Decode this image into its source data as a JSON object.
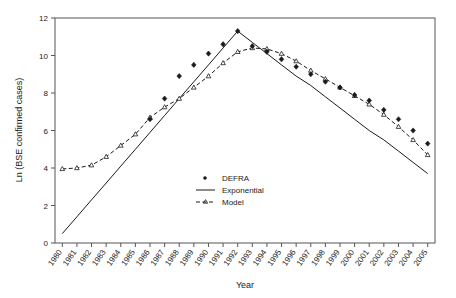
{
  "chart_data": {
    "type": "line",
    "title": "",
    "xlabel": "Year",
    "ylabel": "Ln (BSE confirmed cases)",
    "grid": false,
    "legend_position": "center-right",
    "xlim": [
      1980,
      2005
    ],
    "ylim": [
      0,
      12
    ],
    "yticks": [
      0,
      2,
      4,
      6,
      8,
      10,
      12
    ],
    "categories": [
      "1980",
      "1981",
      "1982",
      "1983",
      "1984",
      "1985",
      "1986",
      "1987",
      "1988",
      "1989",
      "1990",
      "1991",
      "1992",
      "1993",
      "1994",
      "1995",
      "1996",
      "1997",
      "1998",
      "1999",
      "2000",
      "2001",
      "2002",
      "2003",
      "2004",
      "2005"
    ],
    "series": [
      {
        "name": "DEFRA",
        "style": "markers",
        "marker": "filled-diamond",
        "color": "#1a1a1a",
        "values": [
          null,
          null,
          null,
          null,
          null,
          null,
          6.6,
          7.7,
          8.9,
          9.5,
          10.1,
          10.6,
          11.3,
          10.5,
          10.2,
          9.8,
          9.4,
          9.0,
          8.6,
          8.3,
          7.9,
          7.6,
          7.1,
          6.6,
          6.0,
          5.3
        ]
      },
      {
        "name": "Exponential",
        "style": "solid-line",
        "color": "#1a1a1a",
        "values": [
          0.5,
          1.4,
          2.3,
          3.2,
          4.1,
          5.0,
          5.9,
          6.8,
          7.7,
          8.6,
          9.5,
          10.4,
          11.3,
          10.7,
          10.1,
          9.5,
          8.9,
          8.4,
          7.8,
          7.2,
          6.6,
          6.0,
          5.5,
          4.9,
          4.3,
          3.7
        ]
      },
      {
        "name": "Model",
        "style": "dashed-line-markers",
        "marker": "open-triangle",
        "color": "#1a1a1a",
        "values": [
          3.95,
          4.0,
          4.15,
          4.6,
          5.2,
          5.8,
          6.7,
          7.25,
          7.7,
          8.3,
          8.9,
          9.6,
          10.2,
          10.4,
          10.35,
          10.1,
          9.7,
          9.2,
          8.75,
          8.3,
          7.85,
          7.4,
          6.85,
          6.2,
          5.5,
          4.7
        ]
      }
    ]
  },
  "legend": {
    "entries": [
      {
        "label": "DEFRA"
      },
      {
        "label": "Exponential"
      },
      {
        "label": "Model"
      }
    ]
  },
  "axes": {
    "y_label": "Ln (BSE confirmed cases)",
    "x_label": "Year"
  }
}
